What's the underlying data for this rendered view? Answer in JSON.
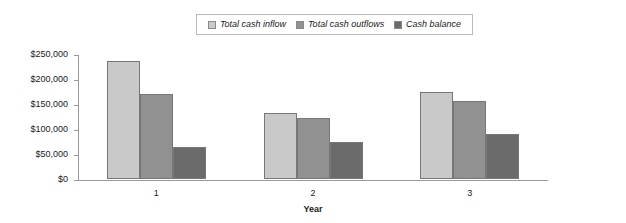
{
  "legend": {
    "position": "top-center",
    "entries": [
      {
        "label": "Total cash inflow",
        "color": "#c9c9c9",
        "icon": "legend-swatch-icon"
      },
      {
        "label": "Total cash outflows",
        "color": "#919191",
        "icon": "legend-swatch-icon"
      },
      {
        "label": "Cash balance",
        "color": "#6b6b6b",
        "icon": "legend-swatch-icon"
      }
    ]
  },
  "chart_data": {
    "type": "bar",
    "title": "",
    "subtitle": "",
    "xlabel": "Year",
    "ylabel": "",
    "categories": [
      "1",
      "2",
      "3"
    ],
    "series": [
      {
        "name": "Total cash inflow",
        "color": "#c9c9c9",
        "values": [
          236000,
          133000,
          175000
        ]
      },
      {
        "name": "Total cash outflows",
        "color": "#919191",
        "values": [
          171000,
          122000,
          157000
        ]
      },
      {
        "name": "Cash balance",
        "color": "#6b6b6b",
        "values": [
          65000,
          75000,
          90000
        ]
      }
    ],
    "ylim": [
      0,
      250000
    ],
    "ytick_values": [
      0,
      50000,
      100000,
      150000,
      200000,
      250000
    ],
    "ytick_labels": [
      "$0",
      "$50,000",
      "$100,000",
      "$150,000",
      "$200,000",
      "$250,000"
    ],
    "grid": false,
    "legend_position": "top-center"
  }
}
